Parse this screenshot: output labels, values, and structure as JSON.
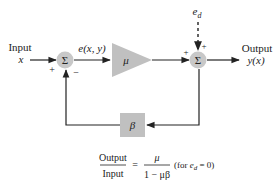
{
  "diagram": {
    "input": {
      "label": "Input",
      "variable": "x",
      "sign": "+"
    },
    "summer_left": {
      "symbol": "Σ",
      "feedback_sign": "−",
      "fill": "#c8c8c8"
    },
    "error_signal": "e(x, y)",
    "amplifier": {
      "symbol": "μ",
      "fill": "#c0c0c0"
    },
    "summer_right": {
      "symbol": "Σ",
      "sign_forward": "+",
      "sign_disturbance": "+",
      "fill": "#c8c8c8"
    },
    "disturbance": {
      "symbol": "e",
      "subscript": "d"
    },
    "output": {
      "label": "Output",
      "variable": "y(x)"
    },
    "feedback": {
      "symbol": "β",
      "fill": "#c0c0c0"
    },
    "formula": {
      "lhs_num": "Output",
      "lhs_den": "Input",
      "equals": "=",
      "rhs_num": "μ",
      "rhs_den": "1 − μβ",
      "condition_prefix": "(for ",
      "condition_var": "e",
      "condition_sub": "d",
      "condition_suffix": " = 0)"
    }
  }
}
